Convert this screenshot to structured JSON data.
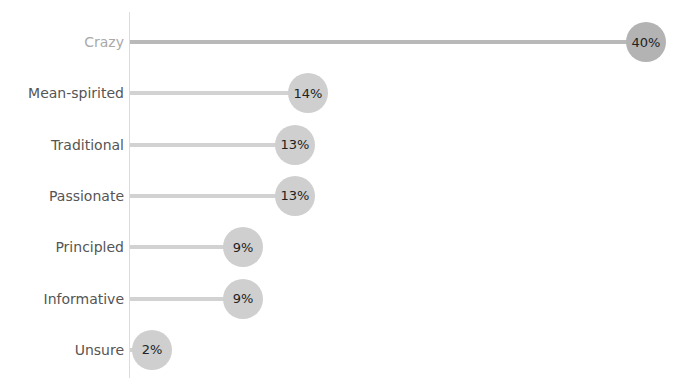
{
  "chart_data": {
    "type": "lollipop",
    "title": "",
    "categories": [
      "Crazy",
      "Mean-spirited",
      "Traditional",
      "Passionate",
      "Principled",
      "Informative",
      "Unsure"
    ],
    "values": [
      40,
      14,
      13,
      13,
      9,
      9,
      2
    ],
    "value_labels": [
      "40%",
      "14%",
      "13%",
      "13%",
      "9%",
      "9%",
      "2%"
    ],
    "xlabel": "",
    "ylabel": "",
    "xlim": [
      0,
      40
    ],
    "grid": false,
    "legend": null,
    "highlighted": "Crazy",
    "colors": {
      "dot": "#cfcfcf",
      "dot_highlight": "#b3b3b3",
      "stem": "#d2d2d2",
      "axis": "#dcdcdc"
    }
  },
  "labels": {
    "r0": "Crazy",
    "r1": "Mean-spirited",
    "r2": "Traditional",
    "r3": "Passionate",
    "r4": "Principled",
    "r5": "Informative",
    "r6": "Unsure"
  },
  "values": {
    "r0": "40%",
    "r1": "14%",
    "r2": "13%",
    "r3": "13%",
    "r4": "9%",
    "r5": "9%",
    "r6": "2%"
  }
}
